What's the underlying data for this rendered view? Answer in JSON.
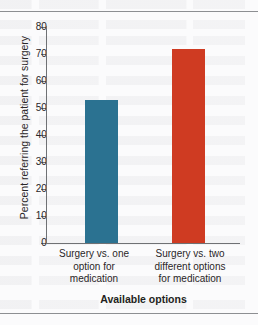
{
  "figure": {
    "background_color": "#fbfbfc",
    "rule_color": "#8d8f92",
    "axis_color": "#6f7174"
  },
  "chart_data": {
    "type": "bar",
    "title": "",
    "subtitle": "",
    "categories": [
      "Surgery vs. one option for medication",
      "Surgery vs. two different options for medication"
    ],
    "category_lines": [
      [
        "Surgery vs. one",
        "option for",
        "medication"
      ],
      [
        "Surgery vs. two",
        "different options",
        "for medication"
      ]
    ],
    "values": [
      53,
      72
    ],
    "xlabel": "Available options",
    "ylabel": "Percent referring the patient for surgery",
    "ylim": [
      0,
      80
    ],
    "ytick_values": [
      80,
      70,
      60,
      50,
      40,
      30,
      20,
      10,
      0
    ],
    "ytick_labels": [
      "80",
      "70",
      "60",
      "50",
      "40",
      "30",
      "20",
      "10",
      "0"
    ],
    "xtick_labels": [],
    "grid": false,
    "legend": false,
    "legend_position": "none",
    "bar_colors": [
      "#2b7291",
      "#cf3b22"
    ],
    "series": [
      {
        "name": "Percent referring the patient for surgery",
        "values": [
          53,
          72
        ]
      }
    ]
  }
}
